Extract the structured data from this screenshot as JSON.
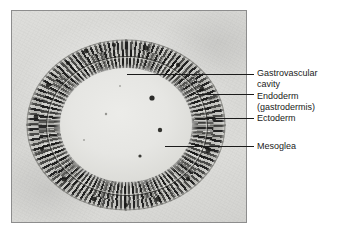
{
  "figure": {
    "kind": "light-micrograph",
    "frame_border_color": "#8d8d8d",
    "slide_background_color": "#d9d9d6",
    "tissue_dark_color": "#2a2a28",
    "cavity_color": "#ecece9",
    "leader_line_color": "#1a1a1a",
    "label_text_color": "#1a1a1a"
  },
  "labels": [
    {
      "id": "gastrovascular-cavity",
      "line1": "Gastrovascular",
      "line2": "cavity",
      "leader": {
        "x1": 127,
        "y1": 74,
        "x2": 254,
        "y2": 74
      }
    },
    {
      "id": "endoderm",
      "line1": "Endoderm",
      "line2": "(gastrodermis)",
      "leader": {
        "x1": 196,
        "y1": 94,
        "x2": 254,
        "y2": 94
      }
    },
    {
      "id": "ectoderm",
      "line1": "Ectoderm",
      "line2": "",
      "leader": {
        "x1": 205,
        "y1": 118,
        "x2": 254,
        "y2": 118
      }
    },
    {
      "id": "mesoglea",
      "line1": "Mesoglea",
      "line2": "",
      "leader": {
        "x1": 165,
        "y1": 146,
        "x2": 254,
        "y2": 146
      }
    }
  ]
}
